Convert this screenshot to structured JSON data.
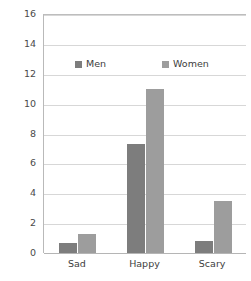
{
  "chart_data": {
    "type": "bar",
    "title": "",
    "subtitle": "",
    "xlabel": "",
    "ylabel": "",
    "categories": [
      "Sad",
      "Happy",
      "Scary"
    ],
    "series": [
      {
        "name": "Men",
        "color": "#7d7d7d",
        "values": [
          0.7,
          7.3,
          0.8
        ]
      },
      {
        "name": "Women",
        "color": "#9d9d9d",
        "values": [
          1.3,
          11.0,
          3.5
        ]
      }
    ],
    "ylim": [
      0,
      16
    ],
    "ytick_step": 2,
    "yticks": [
      16,
      14,
      12,
      10,
      8,
      6,
      4,
      2,
      0
    ],
    "ytick_labels": [
      "16",
      "14",
      "12",
      "10",
      "8",
      "6",
      "4",
      "2",
      "0"
    ],
    "grid": true,
    "grid_axis": "y",
    "legend_position": "upper-center-inside",
    "annotations": []
  },
  "legend": {
    "entries": [
      {
        "label": "Men",
        "swatch": "men-swatch"
      },
      {
        "label": "Women",
        "swatch": "women-swatch"
      }
    ]
  },
  "colors": {
    "men": "#7d7d7d",
    "women": "#9d9d9d",
    "grid": "#d7d7d7",
    "axis": "#b5b5b5",
    "tick_text": "#4a4a4a",
    "label_text": "#3d3d3d",
    "background": "#ffffff"
  }
}
